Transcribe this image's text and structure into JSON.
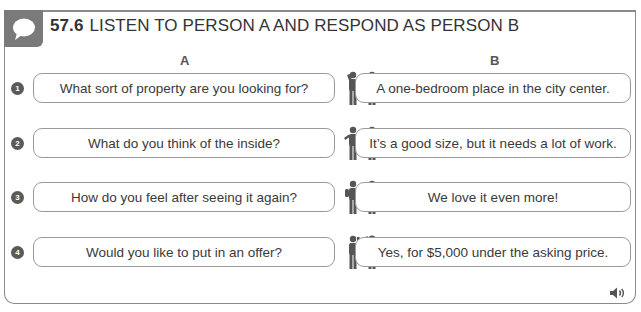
{
  "exercise": {
    "number": "57.6",
    "title": "LISTEN TO PERSON A AND RESPOND AS PERSON B",
    "icon": "speech-bubble-icon",
    "colors": {
      "badge": "#7a7a7a",
      "border": "#8a8a8a",
      "bubble_border": "#9a9a9a",
      "text": "#3a3a3a"
    }
  },
  "columns": {
    "a": "A",
    "b": "B"
  },
  "rows": [
    {
      "num": "1",
      "a": "What sort of property are you looking for?",
      "b": "A one-bedroom place in the city center."
    },
    {
      "num": "2",
      "a": "What do you think of the inside?",
      "b": "It’s a good size, but it needs a lot of work."
    },
    {
      "num": "3",
      "a": "How do you feel after seeing it again?",
      "b": "We love it even more!"
    },
    {
      "num": "4",
      "a": "Would you like to put in an offer?",
      "b": "Yes, for $5,000 under the asking price."
    }
  ],
  "audio": {
    "icon": "speaker-icon"
  }
}
